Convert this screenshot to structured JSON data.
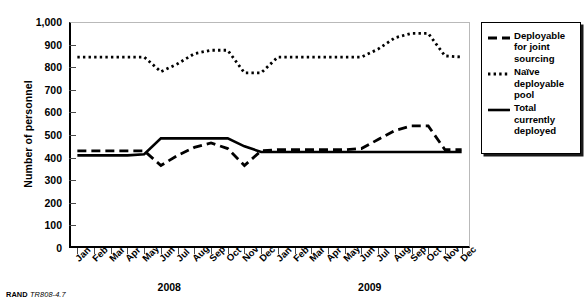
{
  "figure": {
    "footer_prefix": "RAND",
    "footer_code": "TR808-4.7"
  },
  "legend": {
    "items": [
      {
        "label": "Deployable\nfor joint\nsourcing",
        "style": "dashed",
        "color": "#000000"
      },
      {
        "label": "Naïve\ndeployable\npool",
        "style": "dotted",
        "color": "#000000"
      },
      {
        "label": "Total\ncurrently\ndeployed",
        "style": "solid",
        "color": "#000000"
      }
    ]
  },
  "chart_data": {
    "type": "line",
    "title": "",
    "xlabel": "",
    "ylabel": "Number of personnel",
    "ylim": [
      0,
      1000
    ],
    "ytick_step": 100,
    "ytick_labels": [
      "0",
      "100",
      "200",
      "300",
      "400",
      "500",
      "600",
      "700",
      "800",
      "900",
      "1,000"
    ],
    "grid": false,
    "legend_position": "right",
    "categories": [
      "Jan",
      "Feb",
      "Mar",
      "Apr",
      "May",
      "Jun",
      "Jul",
      "Aug",
      "Sep",
      "Oct",
      "Nov",
      "Dec",
      "Jan",
      "Feb",
      "Mar",
      "Apr",
      "May",
      "Jun",
      "Jul",
      "Aug",
      "Sep",
      "Oct",
      "Nov",
      "Dec"
    ],
    "group_labels": [
      {
        "label": "2008",
        "start_index": 0,
        "end_index": 11
      },
      {
        "label": "2009",
        "start_index": 12,
        "end_index": 23
      }
    ],
    "series": [
      {
        "name": "Deployable for joint sourcing",
        "style": "dashed",
        "color": "#000000",
        "values": [
          430,
          430,
          430,
          430,
          430,
          365,
          410,
          445,
          465,
          440,
          365,
          430,
          435,
          435,
          435,
          435,
          435,
          440,
          480,
          520,
          540,
          540,
          435,
          435
        ]
      },
      {
        "name": "Naïve deployable pool",
        "style": "dotted",
        "color": "#000000",
        "values": [
          845,
          845,
          845,
          845,
          845,
          780,
          815,
          860,
          875,
          875,
          775,
          775,
          845,
          845,
          845,
          845,
          845,
          845,
          880,
          930,
          950,
          950,
          850,
          845
        ]
      },
      {
        "name": "Total currently deployed",
        "style": "solid",
        "color": "#000000",
        "values": [
          410,
          410,
          410,
          410,
          415,
          485,
          485,
          485,
          485,
          485,
          450,
          425,
          425,
          425,
          425,
          425,
          425,
          425,
          425,
          425,
          425,
          425,
          425,
          425
        ]
      }
    ]
  }
}
